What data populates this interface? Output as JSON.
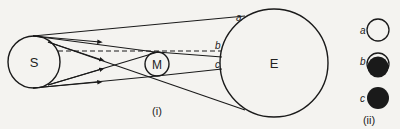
{
  "diagram": {
    "bodies": {
      "sun": "S",
      "moon": "M",
      "earth": "E"
    },
    "points": [
      "a",
      "b",
      "c"
    ],
    "part_labels": {
      "part1": "(i)",
      "part2": "(ii)"
    },
    "views": [
      {
        "label": "a",
        "appearance": "full sun visible"
      },
      {
        "label": "b",
        "appearance": "partial eclipse"
      },
      {
        "label": "c",
        "appearance": "total eclipse"
      }
    ],
    "colors": {
      "ink": "#1a1a1a",
      "paper": "#f4f3f0"
    }
  }
}
